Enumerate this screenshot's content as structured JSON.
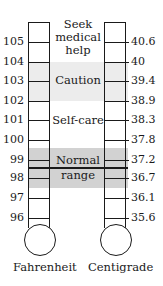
{
  "figure": {
    "type": "thermometer-comparison",
    "colors": {
      "caution_band": "#ececec",
      "normal_band": "#d2d2d2",
      "line": "#1a1a1a"
    }
  },
  "scales": {
    "fahrenheit": {
      "label": "Fahrenheit",
      "ticks": [
        "105",
        "104",
        "103",
        "102",
        "101",
        "100",
        "99",
        "98",
        "97",
        "96"
      ]
    },
    "centigrade": {
      "label": "Centigrade",
      "ticks": [
        "40.6",
        "40",
        "39.4",
        "38.9",
        "38.3",
        "37.8",
        "37.2",
        "36.7",
        "36.1",
        "35.6"
      ]
    }
  },
  "zones": {
    "seek_help": {
      "line1": "Seek",
      "line2": "medical",
      "line3": "help"
    },
    "caution": "Caution",
    "self_care": "Self-care",
    "normal": {
      "line1": "Normal",
      "line2": "range"
    }
  }
}
